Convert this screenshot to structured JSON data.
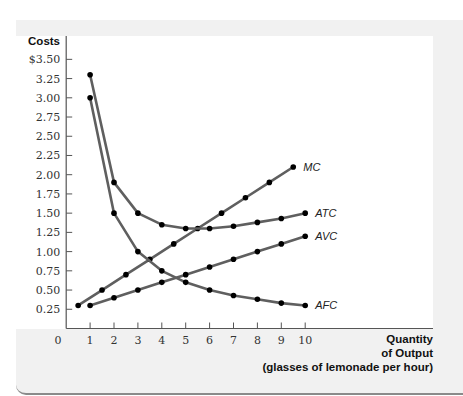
{
  "chart_data": {
    "type": "line",
    "title": "",
    "ylabel": "Costs",
    "xlabel": [
      "Quantity",
      "of Output",
      "(glasses of lemonade per hour)"
    ],
    "ylim": [
      0,
      3.5
    ],
    "xlim": [
      0,
      10
    ],
    "grid": false,
    "y_ticks": [
      "$3.50",
      "3.25",
      "3.00",
      "2.75",
      "2.50",
      "2.25",
      "2.00",
      "1.75",
      "1.50",
      "1.25",
      "1.00",
      "0.75",
      "0.50",
      "0.25"
    ],
    "y_tick_values": [
      3.5,
      3.25,
      3.0,
      2.75,
      2.5,
      2.25,
      2.0,
      1.75,
      1.5,
      1.25,
      1.0,
      0.75,
      0.5,
      0.25
    ],
    "x_ticks": [
      "0",
      "1",
      "2",
      "3",
      "4",
      "5",
      "6",
      "7",
      "8",
      "9",
      "10"
    ],
    "series": [
      {
        "name": "MC",
        "x": [
          0.5,
          1.5,
          2.5,
          3.5,
          4.5,
          5.5,
          6.5,
          7.5,
          8.5,
          9.5
        ],
        "values": [
          0.3,
          0.5,
          0.7,
          0.9,
          1.1,
          1.3,
          1.5,
          1.7,
          1.9,
          2.1
        ]
      },
      {
        "name": "ATC",
        "x": [
          1,
          2,
          3,
          4,
          5,
          6,
          7,
          8,
          9,
          10
        ],
        "values": [
          3.3,
          1.9,
          1.5,
          1.35,
          1.3,
          1.3,
          1.33,
          1.38,
          1.43,
          1.5
        ]
      },
      {
        "name": "AVC",
        "x": [
          1,
          2,
          3,
          4,
          5,
          6,
          7,
          8,
          9,
          10
        ],
        "values": [
          0.3,
          0.4,
          0.5,
          0.6,
          0.7,
          0.8,
          0.9,
          1.0,
          1.1,
          1.2
        ]
      },
      {
        "name": "AFC",
        "x": [
          1,
          2,
          3,
          4,
          5,
          6,
          7,
          8,
          9,
          10
        ],
        "values": [
          3.0,
          1.5,
          1.0,
          0.75,
          0.6,
          0.5,
          0.43,
          0.38,
          0.33,
          0.3
        ]
      }
    ],
    "legend": "inline labels at curve ends"
  },
  "colors": {
    "curve": "#5f5f5f",
    "point": "#000000",
    "axis": "#555555",
    "frame": "#f1f1f1"
  }
}
